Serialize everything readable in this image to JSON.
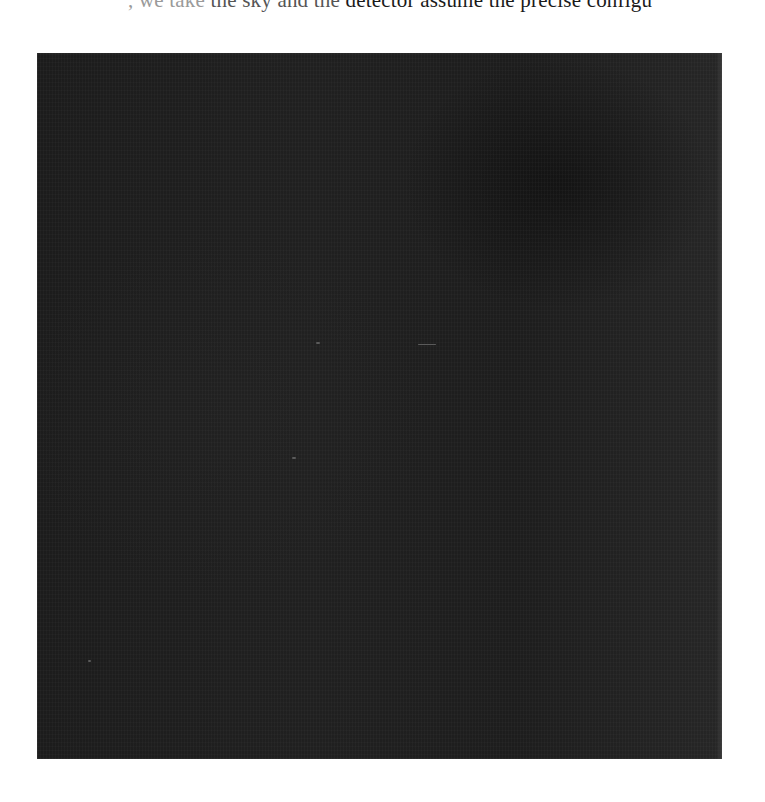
{
  "document": {
    "top_text_fragment": {
      "faint": ", we take",
      "mid": " the sky and the ",
      "dark": "detector assume the precise configu"
    }
  },
  "figure": {
    "background_color": "#1e1e1e",
    "features": [
      {
        "name": "dot",
        "x": 316,
        "y": 342,
        "w": 4,
        "h": 2
      },
      {
        "name": "dash",
        "x": 418,
        "y": 344,
        "w": 18,
        "h": 1
      },
      {
        "name": "dot",
        "x": 292,
        "y": 457,
        "w": 4,
        "h": 2
      },
      {
        "name": "dot",
        "x": 88,
        "y": 660,
        "w": 3,
        "h": 2
      }
    ]
  }
}
